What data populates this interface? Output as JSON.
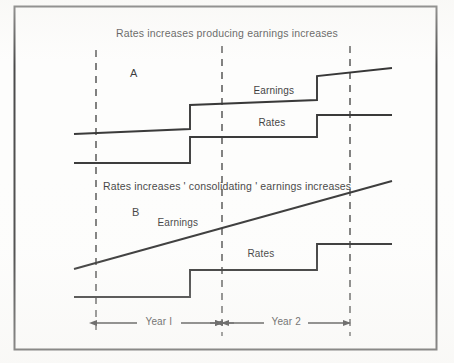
{
  "figure": {
    "panels": [
      {
        "id": "A",
        "letter": "A",
        "letter_x": 134,
        "letter_y": 74,
        "title": "Rates increases producing earnings increases",
        "title_x": 227,
        "title_y": 34,
        "series": [
          {
            "name": "Earnings",
            "label": "Earnings",
            "label_x": 274,
            "label_y": 92,
            "shape": "stepped-rising",
            "points": "74,134 190,129 190,105 317,100 317,76 392,68"
          },
          {
            "name": "Rates",
            "label": "Rates",
            "label_x": 272,
            "label_y": 124,
            "shape": "stepped-flat",
            "points": "74,163 190,163 190,137 317,137 317,115 392,115"
          }
        ]
      },
      {
        "id": "B",
        "letter": "B",
        "letter_x": 136,
        "letter_y": 213,
        "title": "Rates increases ' consolidating ' earnings increases",
        "title_x": 227,
        "title_y": 187,
        "series": [
          {
            "name": "Earnings",
            "label": "Earnings",
            "label_x": 178,
            "label_y": 224,
            "shape": "straight-rising",
            "points": "74,269 392,181"
          },
          {
            "name": "Rates",
            "label": "Rates",
            "label_x": 261,
            "label_y": 255,
            "shape": "stepped-flat",
            "points": "74,297 190,297 190,270 317,270 317,244 392,244"
          }
        ]
      }
    ],
    "gridlines": [
      {
        "name": "year-0-boundary",
        "x": 96,
        "y1": 50,
        "y2": 336
      },
      {
        "name": "year-1-boundary",
        "x": 222,
        "y1": 46,
        "y2": 336
      },
      {
        "name": "year-2-boundary",
        "x": 350,
        "y1": 46,
        "y2": 336
      }
    ],
    "axis": {
      "y": 323,
      "spans": [
        {
          "label": "Year I",
          "x1": 96,
          "x2": 222,
          "label_x": 159,
          "label_y": 323
        },
        {
          "label": "Year 2",
          "x1": 222,
          "x2": 350,
          "label_x": 286,
          "label_y": 323
        }
      ]
    },
    "border": {
      "x": 14,
      "y": 6,
      "width": 422,
      "height": 343
    },
    "colors": {
      "ink": "#1a1a1a",
      "line": "#141414",
      "dashed": "#2a2a2a",
      "paper": "#fdfdfc",
      "border": "#2b2b2b"
    }
  },
  "chart_data": {
    "type": "line",
    "xlabel": "",
    "ylabel": "",
    "grid": true,
    "legend": "inline-labels",
    "x_ticks": [
      "Year I",
      "Year 2"
    ],
    "panels": [
      {
        "panel": "A",
        "title": "Rates increases producing earnings increases",
        "series": [
          {
            "name": "Earnings",
            "style": "step-with-slope",
            "x": [
              0,
              0.92,
              0.92,
              1.93,
              1.93,
              2.52
            ],
            "y": [
              30,
              32,
              42,
              44,
              54,
              57
            ]
          },
          {
            "name": "Rates",
            "style": "step",
            "x": [
              0,
              0.92,
              0.92,
              1.93,
              1.93,
              2.52
            ],
            "y": [
              18,
              18,
              29,
              29,
              38,
              38
            ]
          }
        ]
      },
      {
        "panel": "B",
        "title": "Rates increases ' consolidating ' earnings increases",
        "series": [
          {
            "name": "Earnings",
            "style": "linear",
            "x": [
              0,
              2.52
            ],
            "y": [
              22,
              58
            ]
          },
          {
            "name": "Rates",
            "style": "step",
            "x": [
              0,
              0.92,
              0.92,
              1.93,
              1.93,
              2.52
            ],
            "y": [
              10,
              10,
              21,
              21,
              32,
              32
            ]
          }
        ]
      }
    ]
  }
}
